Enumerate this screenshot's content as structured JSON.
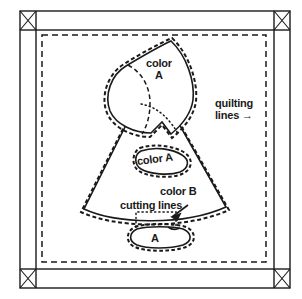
{
  "figure": {
    "colors": {
      "ink": "#1a1a1a",
      "background": "#ffffff"
    },
    "labels": {
      "color_a_bonnet_line1": "color",
      "color_a_bonnet_line2": "A",
      "quilting_lines_line1": "quilting",
      "quilting_lines_line2": "lines",
      "quilting_lines_arrow": "→",
      "color_a_hand": "color A",
      "color_b": "color B",
      "cutting_lines": "cutting lines",
      "shoe_a": "A"
    },
    "line_styles": {
      "sewing_line": "solid",
      "cutting_line": "dashed",
      "quilting_line": "dashed",
      "hidden_edge": "dotted"
    },
    "corner_blocks": {
      "count": 4,
      "marking": "X"
    }
  }
}
